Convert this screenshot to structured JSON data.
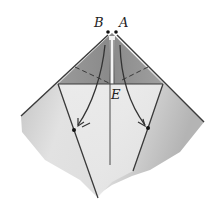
{
  "diagram": {
    "type": "origami-fold-step",
    "labels": {
      "point_b": "B",
      "point_a": "A",
      "point_e": "E"
    },
    "colors": {
      "paper_light": "#e9e9e9",
      "paper_mid": "#c9c9c9",
      "paper_dark": "#a5a5a5",
      "top_flap": "#8f8f8f",
      "line": "#3a3a3a",
      "background": "#ffffff"
    },
    "elements": [
      {
        "name": "outer-paper-shape",
        "kind": "polygon"
      },
      {
        "name": "top-triangle-flap",
        "kind": "polygon"
      },
      {
        "name": "horizontal-crease",
        "kind": "line"
      },
      {
        "name": "center-crease",
        "kind": "line"
      },
      {
        "name": "left-fold-line",
        "kind": "line"
      },
      {
        "name": "right-fold-line",
        "kind": "line"
      },
      {
        "name": "left-dashed-valley-fold",
        "kind": "dashed-line"
      },
      {
        "name": "right-dashed-valley-fold",
        "kind": "dashed-line"
      },
      {
        "name": "left-curved-arrow",
        "kind": "arrow"
      },
      {
        "name": "right-curved-arrow",
        "kind": "arrow"
      },
      {
        "name": "left-reference-dot",
        "kind": "dot"
      },
      {
        "name": "right-reference-dot",
        "kind": "dot"
      },
      {
        "name": "point-b-dot",
        "kind": "dot"
      },
      {
        "name": "point-a-dot",
        "kind": "dot"
      }
    ]
  }
}
